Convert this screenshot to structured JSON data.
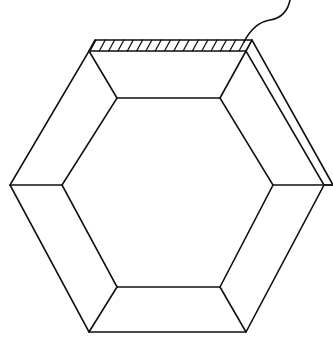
{
  "diagram": {
    "stroke_color": "#111111",
    "background_color": "#ffffff",
    "outer_hexagon": [
      [
        89,
        51
      ],
      [
        246,
        51
      ],
      [
        324,
        185
      ],
      [
        246,
        332
      ],
      [
        89,
        332
      ],
      [
        10,
        185
      ]
    ],
    "inner_hexagon": [
      [
        117,
        98
      ],
      [
        220,
        98
      ],
      [
        273,
        185
      ],
      [
        220,
        287
      ],
      [
        117,
        287
      ],
      [
        62,
        185
      ]
    ],
    "back_edge": [
      [
        95,
        40
      ],
      [
        252,
        40
      ],
      [
        333,
        185
      ],
      [
        324,
        185
      ]
    ],
    "hatch_count": 17,
    "string": {
      "description": "wavy cord rising from top-right corner",
      "path": "M244 42 C 250 30, 258 22, 270 20 C 282 18, 288 10, 290 0"
    },
    "labels": []
  }
}
